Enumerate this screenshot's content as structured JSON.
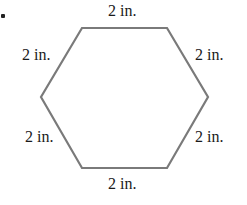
{
  "figure": {
    "shape": "regular hexagon",
    "stroke_color": "#7a7a7a",
    "vertices": [
      [
        82,
        28
      ],
      [
        167,
        28
      ],
      [
        208,
        97
      ],
      [
        167,
        168
      ],
      [
        82,
        168
      ],
      [
        41,
        97
      ]
    ],
    "labels": {
      "top": "2 in.",
      "upper_left": "2 in.",
      "upper_right": "2 in.",
      "lower_left": "2 in.",
      "lower_right": "2 in.",
      "bottom": "2 in."
    }
  }
}
